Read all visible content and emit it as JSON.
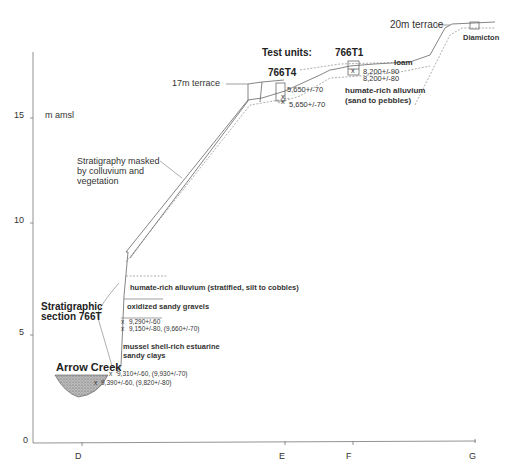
{
  "figure": {
    "y_axis": {
      "unit_label": "m amsl",
      "ticks": [
        {
          "label": "0",
          "value": 0
        },
        {
          "label": "5",
          "value": 5
        },
        {
          "label": "10",
          "value": 10
        },
        {
          "label": "15",
          "value": 15
        }
      ]
    },
    "x_axis": {
      "ticks": [
        {
          "label": "D"
        },
        {
          "label": "E"
        },
        {
          "label": "F"
        },
        {
          "label": "G"
        }
      ]
    },
    "terraces": {
      "t17": "17m terrace",
      "t20": "20m terrace"
    },
    "test_units": {
      "heading": "Test units:",
      "t4": {
        "name": "766T4",
        "dates": [
          "5,650+/-70",
          "5,650+/-70"
        ]
      },
      "t1": {
        "name": "766T1",
        "dates": [
          "8,200+/-90",
          "8,200+/-80"
        ]
      }
    },
    "upper_units": {
      "loam": "loam",
      "alluvium_line1": "humate-rich alluvium",
      "alluvium_line2": "(sand to pebbles)",
      "diamicton": "Diamicton"
    },
    "masked_note": {
      "line1": "Stratigraphy masked",
      "line2": "by colluvium and",
      "line3": "vegetation"
    },
    "section_766T": {
      "title_line1": "Stratigraphic",
      "title_line2": "section 766T",
      "layers": [
        "humate-rich alluvium (stratified, silt to cobbles)",
        "oxidized sandy gravels",
        "mussel shell-rich estuarine",
        "sandy clays"
      ],
      "dates_upper": [
        "9,290+/-60",
        "9,150+/-80, (9,660+/-70)"
      ],
      "dates_lower": [
        "9,310+/-60, (9,930+/-70)",
        "9,390+/-60, (9,820+/-80)"
      ],
      "sample_marker": "x"
    },
    "creek": {
      "name": "Arrow Creek"
    }
  }
}
